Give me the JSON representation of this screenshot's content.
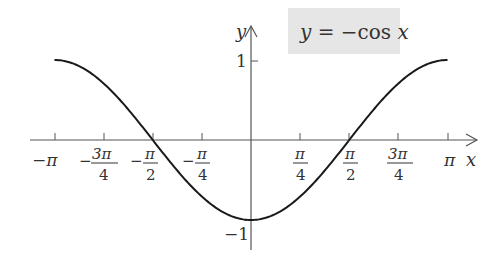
{
  "chart_data": {
    "type": "line",
    "title": "y = −cos x",
    "function": "y = -cos(x)",
    "xlabel": "x",
    "ylabel": "y",
    "xlim": [
      -3.14159,
      3.14159
    ],
    "ylim": [
      -1,
      1
    ],
    "grid": false,
    "x_ticks": [
      {
        "value": -3.14159,
        "label": "−π"
      },
      {
        "value": -2.35619,
        "label": "−3π/4"
      },
      {
        "value": -1.5708,
        "label": "−π/2"
      },
      {
        "value": -0.7854,
        "label": "−π/4"
      },
      {
        "value": 0.7854,
        "label": "π/4"
      },
      {
        "value": 1.5708,
        "label": "π/2"
      },
      {
        "value": 2.35619,
        "label": "3π/4"
      },
      {
        "value": 3.14159,
        "label": "π"
      }
    ],
    "y_ticks": [
      {
        "value": 1,
        "label": "1"
      },
      {
        "value": -1,
        "label": "−1"
      }
    ],
    "series": [
      {
        "name": "y = −cos x",
        "x": [
          -3.14159,
          -2.35619,
          -1.5708,
          -0.7854,
          0,
          0.7854,
          1.5708,
          2.35619,
          3.14159
        ],
        "values": [
          1,
          0.7071,
          0,
          -0.7071,
          -1,
          -0.7071,
          0,
          0.7071,
          1
        ]
      }
    ]
  },
  "labels": {
    "equation_y": "y",
    "equation_eq": " = −cos ",
    "equation_x": "x",
    "axis_y": "y",
    "axis_x": "x",
    "tick_y_pos1": "1",
    "tick_y_neg1": "−1",
    "tick_neg_pi": "−π",
    "tick_pi": "π",
    "pi": "π",
    "three_pi": "3π",
    "four": "4",
    "two": "2",
    "minus": "−"
  },
  "colors": {
    "curve": "#1a1a1a",
    "axis": "#555555",
    "label_box": "#e6e6e6"
  }
}
